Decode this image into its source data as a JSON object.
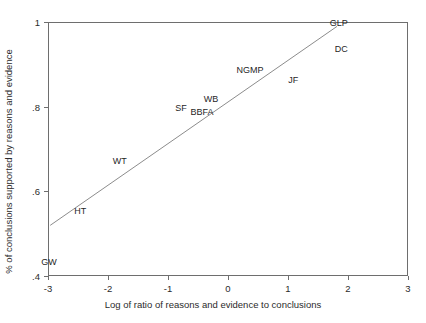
{
  "chart_data": {
    "type": "scatter",
    "title": "",
    "xlabel": "Log of ratio of reasons and evidence to conclusions",
    "ylabel": "% of conclusions supported by reasons and evidence",
    "xlim": [
      -3,
      3
    ],
    "ylim": [
      0.4,
      1.0
    ],
    "xticks": [
      -3,
      -2,
      -1,
      0,
      1,
      2,
      3
    ],
    "xticklabels": [
      "-3",
      "-2",
      "-1",
      "0",
      "1",
      "2",
      "3"
    ],
    "yticks": [
      0.4,
      0.6,
      0.8,
      1.0
    ],
    "yticklabels": [
      ".4",
      ".6",
      ".8",
      "1"
    ],
    "grid": false,
    "legend": null,
    "marker_style": "text-label-only",
    "points": [
      {
        "label": "GW",
        "x": -3.0,
        "y": 0.435
      },
      {
        "label": "HT",
        "x": -2.48,
        "y": 0.555
      },
      {
        "label": "WT",
        "x": -1.82,
        "y": 0.675
      },
      {
        "label": "SF",
        "x": -0.8,
        "y": 0.8
      },
      {
        "label": "BBFA",
        "x": -0.45,
        "y": 0.79
      },
      {
        "label": "WB",
        "x": -0.3,
        "y": 0.82
      },
      {
        "label": "NGMP",
        "x": 0.35,
        "y": 0.89
      },
      {
        "label": "JF",
        "x": 1.07,
        "y": 0.865
      },
      {
        "label": "DC",
        "x": 1.87,
        "y": 0.938
      },
      {
        "label": "GLP",
        "x": 1.83,
        "y": 1.0
      }
    ],
    "fit_line": {
      "name": "linear-fit",
      "x_start": -2.98,
      "y_start": 0.522,
      "x_end": 1.8,
      "y_end": 0.992,
      "color": "#8c8c8c"
    },
    "colors": {
      "axis": "#6e6e6e",
      "text": "#2b2b2b",
      "fit_line": "#8c8c8c",
      "background": "#ffffff"
    }
  }
}
